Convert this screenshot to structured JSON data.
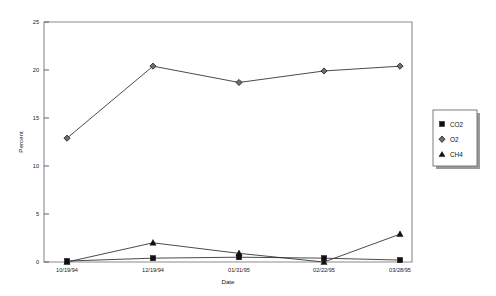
{
  "chart_data": {
    "type": "line",
    "title": "",
    "subtitle": "",
    "xlabel": "Date",
    "ylabel": "Percent",
    "categories": [
      "10/19/94",
      "12/19/94",
      "01/31/95",
      "02/22/95",
      "03/28/95"
    ],
    "x_tick_labels": [
      "10/19/94",
      "12/19/94",
      "01/31/95",
      "02/22/95",
      "03/28/95"
    ],
    "y_tick_labels": [
      "0",
      "5",
      "10",
      "15",
      "20",
      "25"
    ],
    "y_ticks": [
      0,
      5,
      10,
      15,
      20,
      25
    ],
    "ylim": [
      0,
      25
    ],
    "grid": false,
    "legend_position": "right-outside",
    "series": [
      {
        "name": "CO2",
        "marker": "filled-square",
        "values": [
          0.1,
          0.4,
          0.5,
          0.4,
          0.2
        ]
      },
      {
        "name": "O2",
        "marker": "diamond",
        "values": [
          12.9,
          20.4,
          18.7,
          19.9,
          20.4
        ]
      },
      {
        "name": "CH4",
        "marker": "triangle",
        "values": [
          0.0,
          2.0,
          0.9,
          0.0,
          2.9
        ]
      }
    ]
  },
  "legend": {
    "entries": [
      {
        "label": "CO2",
        "marker": "filled-square"
      },
      {
        "label": "O2",
        "marker": "diamond"
      },
      {
        "label": "CH4",
        "marker": "triangle"
      }
    ]
  },
  "axes": {
    "y_axis_title": "Percent",
    "x_axis_title": "Date"
  },
  "colors": {
    "series_line": "#2b2b2b",
    "frame": "#8c8c8c",
    "text": "#111111",
    "background": "#ffffff"
  }
}
